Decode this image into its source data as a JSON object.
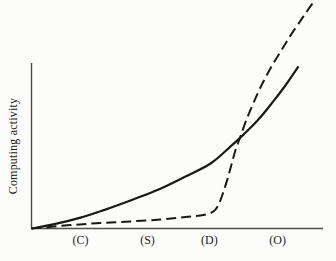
{
  "figure": {
    "width": 336,
    "height": 261,
    "background": "#fcfcfb",
    "ink_color": "#191919",
    "axis_color": "#4d4d4d",
    "text_color": "#1c1c1c"
  },
  "chart_data": {
    "type": "line",
    "title": "",
    "xlabel": "",
    "ylabel": "Computing activity",
    "grid": false,
    "legend": "none",
    "x_range": [
      0,
      1
    ],
    "y_range": [
      0,
      1
    ],
    "x_tick_labels": [
      {
        "label": "(C)",
        "x": 0.164
      },
      {
        "label": "(S)",
        "x": 0.388
      },
      {
        "label": "(D)",
        "x": 0.595
      },
      {
        "label": "(O)",
        "x": 0.823
      }
    ],
    "series": [
      {
        "id": "solid-curve",
        "name": "solid smooth growth curve",
        "line_style": "solid",
        "color": "#191919",
        "points": [
          [
            0.0,
            0.0
          ],
          [
            0.08,
            0.02
          ],
          [
            0.164,
            0.048
          ],
          [
            0.247,
            0.083
          ],
          [
            0.331,
            0.123
          ],
          [
            0.425,
            0.171
          ],
          [
            0.515,
            0.228
          ],
          [
            0.599,
            0.285
          ],
          [
            0.666,
            0.36
          ],
          [
            0.709,
            0.412
          ],
          [
            0.759,
            0.478
          ],
          [
            0.806,
            0.553
          ],
          [
            0.849,
            0.627
          ],
          [
            0.893,
            0.711
          ]
        ]
      },
      {
        "id": "dashed-curve",
        "name": "dashed delayed steep growth curve",
        "line_style": "dashed",
        "color": "#191919",
        "points": [
          [
            0.0,
            0.0
          ],
          [
            0.13,
            0.015
          ],
          [
            0.231,
            0.024
          ],
          [
            0.331,
            0.031
          ],
          [
            0.431,
            0.039
          ],
          [
            0.515,
            0.05
          ],
          [
            0.565,
            0.057
          ],
          [
            0.599,
            0.068
          ],
          [
            0.615,
            0.083
          ],
          [
            0.629,
            0.114
          ],
          [
            0.642,
            0.162
          ],
          [
            0.656,
            0.219
          ],
          [
            0.669,
            0.281
          ],
          [
            0.682,
            0.342
          ],
          [
            0.699,
            0.404
          ],
          [
            0.719,
            0.478
          ],
          [
            0.743,
            0.553
          ],
          [
            0.769,
            0.627
          ],
          [
            0.799,
            0.702
          ],
          [
            0.833,
            0.776
          ],
          [
            0.866,
            0.846
          ],
          [
            0.9,
            0.912
          ],
          [
            0.923,
            0.956
          ],
          [
            0.94,
            0.987
          ]
        ]
      }
    ]
  }
}
